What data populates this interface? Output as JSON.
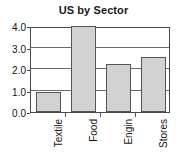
{
  "chart_data": {
    "type": "bar",
    "title": "US by Sector",
    "xlabel": "",
    "ylabel": "",
    "categories": [
      "Textile",
      "Food",
      "Engin",
      "Stores"
    ],
    "values": [
      0.95,
      4.0,
      2.25,
      2.57
    ],
    "ylim": [
      0.0,
      4.0
    ],
    "yticks": [
      "0.0",
      "1.0",
      "2.0",
      "3.0",
      "4.0"
    ],
    "ytick_values": [
      0.0,
      1.0,
      2.0,
      3.0,
      4.0
    ],
    "grid": true,
    "legend": "none",
    "bar_fill_color": "#d2d2d2",
    "bar_border_color": "#555555",
    "axis_color": "#4a4a4a",
    "text_color": "#141414",
    "background_color": "#ffffff"
  }
}
